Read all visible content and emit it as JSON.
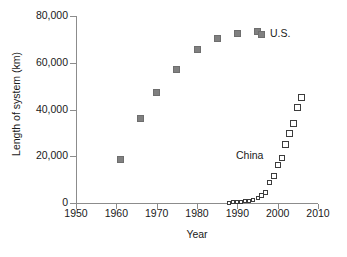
{
  "chart_data": {
    "type": "scatter",
    "title": "",
    "xlabel": "Year",
    "ylabel": "Length of system (km)",
    "xlim": [
      1950,
      2010
    ],
    "ylim": [
      0,
      80000
    ],
    "xticks": [
      1950,
      1960,
      1970,
      1980,
      1990,
      2000,
      2010
    ],
    "xticklabels": [
      "1950",
      "1960",
      "1970",
      "1980",
      "1990",
      "2000",
      "2010"
    ],
    "yticks": [
      0,
      20000,
      40000,
      60000,
      80000
    ],
    "yticklabels": [
      "0",
      "20,000",
      "40,000",
      "60,000",
      "80,000"
    ],
    "grid": false,
    "legend_position": "in-plot-annotations",
    "series": [
      {
        "name": "U.S.",
        "label": "U.S.",
        "marker": "filled-square",
        "color": "#808080",
        "label_x": 1998,
        "label_y": 76000,
        "points": [
          {
            "x": 1961,
            "y": 18400
          },
          {
            "x": 1966,
            "y": 36000
          },
          {
            "x": 1970,
            "y": 47200
          },
          {
            "x": 1975,
            "y": 57000
          },
          {
            "x": 1980,
            "y": 65800
          },
          {
            "x": 1985,
            "y": 70200
          },
          {
            "x": 1990,
            "y": 72600
          },
          {
            "x": 1995,
            "y": 73200
          }
        ]
      },
      {
        "name": "China",
        "label": "China",
        "marker": "open-square",
        "color": "#3c3c3c",
        "label_x": 1992,
        "label_y": 23000,
        "points": [
          {
            "x": 1988,
            "y": 150
          },
          {
            "x": 1989,
            "y": 250
          },
          {
            "x": 1990,
            "y": 400
          },
          {
            "x": 1991,
            "y": 550
          },
          {
            "x": 1992,
            "y": 700
          },
          {
            "x": 1993,
            "y": 1000
          },
          {
            "x": 1994,
            "y": 1400
          },
          {
            "x": 1995,
            "y": 2100
          },
          {
            "x": 1996,
            "y": 3300
          },
          {
            "x": 1997,
            "y": 4700
          },
          {
            "x": 1998,
            "y": 8700
          },
          {
            "x": 1999,
            "y": 11600
          },
          {
            "x": 2000,
            "y": 16300
          },
          {
            "x": 2001,
            "y": 19400
          },
          {
            "x": 2002,
            "y": 25100
          },
          {
            "x": 2003,
            "y": 29700
          },
          {
            "x": 2004,
            "y": 34200
          },
          {
            "x": 2005,
            "y": 41000
          },
          {
            "x": 2006,
            "y": 45000
          }
        ]
      }
    ]
  }
}
